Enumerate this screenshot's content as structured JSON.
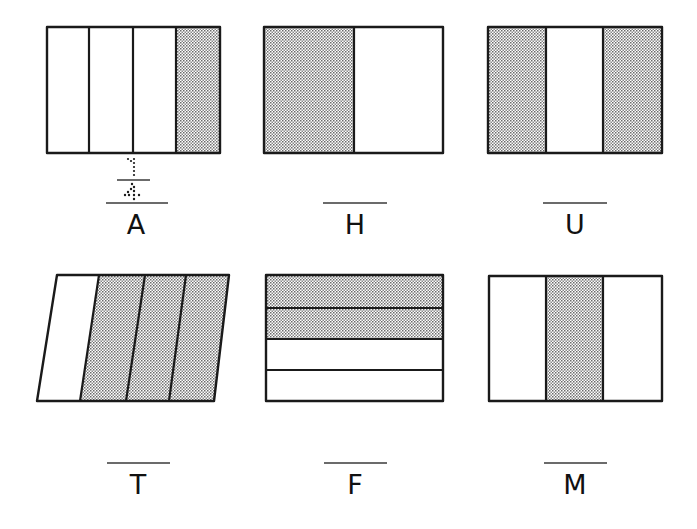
{
  "worksheet": {
    "instruction_style": "Write the fraction of each shape that is shaded on the blank line.",
    "shade_color": "#9a9a9a",
    "panels": [
      {
        "id": "A",
        "label": "A",
        "shape": "rectangle",
        "orientation": "vertical",
        "parts": 4,
        "shaded_parts": [
          4
        ],
        "answer_written": "1/4",
        "answer_style": "dotted"
      },
      {
        "id": "H",
        "label": "H",
        "shape": "rectangle",
        "orientation": "vertical",
        "parts": 2,
        "shaded_parts": [
          1
        ],
        "answer_written": ""
      },
      {
        "id": "U",
        "label": "U",
        "shape": "rectangle",
        "orientation": "vertical",
        "parts": 3,
        "shaded_parts": [
          1,
          3
        ],
        "answer_written": ""
      },
      {
        "id": "T",
        "label": "T",
        "shape": "parallelogram",
        "orientation": "vertical",
        "parts": 4,
        "shaded_parts": [
          2,
          3,
          4
        ],
        "answer_written": ""
      },
      {
        "id": "F",
        "label": "F",
        "shape": "rectangle",
        "orientation": "horizontal",
        "parts": 4,
        "shaded_parts": [
          1,
          2
        ],
        "answer_written": ""
      },
      {
        "id": "M",
        "label": "M",
        "shape": "rectangle",
        "orientation": "vertical",
        "parts": 3,
        "shaded_parts": [
          2
        ],
        "answer_written": ""
      }
    ]
  }
}
